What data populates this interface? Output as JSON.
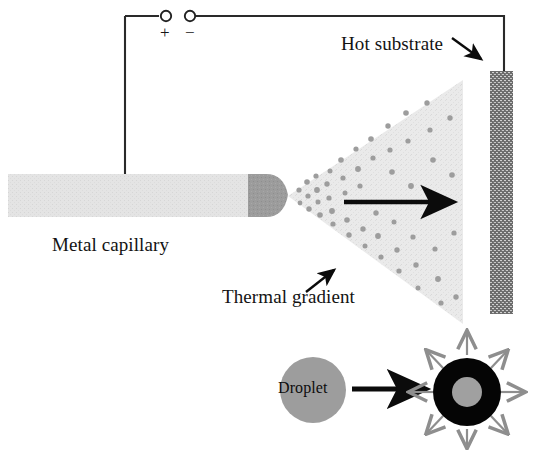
{
  "figure": {
    "type": "schematic-diagram",
    "width": 541,
    "height": 450,
    "background": "#ffffff"
  },
  "labels": {
    "metal_capillary": "Metal capillary",
    "hot_substrate": "Hot substrate",
    "thermal_gradient": "Thermal gradient",
    "droplet": "Droplet",
    "polarity_positive": "+",
    "polarity_negative": "−"
  },
  "colors": {
    "capillary_body": "#e3e3e3",
    "capillary_tip": "#9a9a9a",
    "spray_cone": "#e8e8e8",
    "spray_droplet_dot": "#9d9d9d",
    "substrate": "#6f6f6f",
    "substrate_pattern": "#cfcfcf",
    "wire": "#2a2a2a",
    "arrow_black": "#0b0b0b",
    "arrow_gray": "#8e8e8e",
    "droplet_gray": "#9d9d9d",
    "shell_black": "#050505",
    "core_gray": "#a0a0a0",
    "text": "#131313"
  },
  "components": {
    "circuit": {
      "name": "power-supply-circuit",
      "terminal_left": {
        "cx": 166,
        "cy": 16,
        "r": 5
      },
      "terminal_right": {
        "cx": 190,
        "cy": 16,
        "r": 5
      },
      "wire_left_path": "M 125 16 L 125 178",
      "wire_right_path": "M 196 16 L 504 16 L 504 72",
      "wire_width": 2
    },
    "capillary": {
      "name": "metal-capillary",
      "body": {
        "x": 8,
        "y": 174,
        "width": 240,
        "height": 42
      },
      "tip": {
        "x": 248,
        "y": 174,
        "width": 42,
        "height": 42
      }
    },
    "spray_cone": {
      "name": "spray-cone",
      "apex": {
        "x": 288,
        "y": 196
      },
      "top_right": {
        "x": 463,
        "y": 80
      },
      "bottom_right": {
        "x": 463,
        "y": 324
      },
      "droplet_count": 48
    },
    "substrate": {
      "name": "hot-substrate",
      "x": 490,
      "y": 71,
      "width": 22,
      "height": 242
    },
    "flow_arrow": {
      "name": "spray-direction-arrow",
      "from": {
        "x": 344,
        "y": 202
      },
      "to": {
        "x": 462,
        "y": 202
      }
    },
    "hot_substrate_pointer": {
      "name": "hot-substrate-pointer-arrow",
      "from": {
        "x": 455,
        "y": 40
      },
      "to": {
        "x": 484,
        "y": 62
      }
    },
    "thermal_gradient_pointer": {
      "name": "thermal-gradient-pointer-arrow",
      "from": {
        "x": 308,
        "y": 290
      },
      "to": {
        "x": 336,
        "y": 268
      }
    },
    "droplet_inset": {
      "name": "droplet-evaporation-inset",
      "droplet_circle": {
        "cx": 313,
        "cy": 390,
        "r": 33
      },
      "transform_arrow": {
        "from": {
          "x": 352,
          "y": 389
        },
        "to": {
          "x": 432,
          "y": 389
        }
      },
      "shell_circle": {
        "cx": 467,
        "cy": 392,
        "r": 34
      },
      "core_circle": {
        "cx": 467,
        "cy": 392,
        "r": 15
      },
      "radiating_arrow_count": 8
    }
  }
}
